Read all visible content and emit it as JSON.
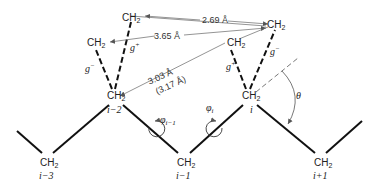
{
  "diagram": {
    "type": "polymer chain conformation (polyethylene)",
    "atoms": {
      "backbone": [
        {
          "label": "CH2",
          "index": "i−3"
        },
        {
          "label": "CH2",
          "index": "i−2"
        },
        {
          "label": "CH2",
          "index": "i−1"
        },
        {
          "label": "CH2",
          "index": "i"
        },
        {
          "label": "CH2",
          "index": "i+1"
        }
      ],
      "side_left": [
        {
          "label": "CH2",
          "conformation": "g+"
        },
        {
          "label": "CH2",
          "conformation": "g−"
        }
      ],
      "side_right": [
        {
          "label": "CH2",
          "conformation": "g−"
        },
        {
          "label": "CH2",
          "conformation": "g+"
        }
      ]
    },
    "distances": {
      "d1": "2.69 Å",
      "d2": "3.65 Å",
      "d3": "3.03 Å",
      "d3_alt": "(3.17 Å)"
    },
    "labels": {
      "ch": "CH",
      "sub2": "2",
      "g_plus": "g",
      "g_minus": "g",
      "plus": "+",
      "minus": "−",
      "phi_prev": "φ",
      "phi_prev_sub": "i−1",
      "phi_i": "φ",
      "phi_i_sub": "i",
      "theta": "θ",
      "idx_i3": "i−3",
      "idx_i2": "i−2",
      "idx_i1": "i−1",
      "idx_i": "i",
      "idx_ip1": "i+1"
    }
  }
}
